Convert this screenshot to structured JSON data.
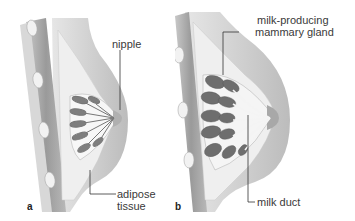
{
  "figure": {
    "panels": [
      {
        "id": "a",
        "letter": "a",
        "labels": {
          "nipple": "nipple",
          "adipose_line1": "adipose",
          "adipose_line2": "tissue"
        }
      },
      {
        "id": "b",
        "letter": "b",
        "labels": {
          "gland_line1": "milk-producing",
          "gland_line2": "mammary gland",
          "duct": "milk duct"
        }
      }
    ],
    "colors": {
      "background": "#ffffff",
      "skin": "#d4d4d4",
      "skin_shadow": "#bdbdbd",
      "fat": "#ececec",
      "muscle": "#a8a8a8",
      "lobule": "#7a7a7a",
      "leader_line": "#333333",
      "text": "#3a3a3a"
    }
  }
}
